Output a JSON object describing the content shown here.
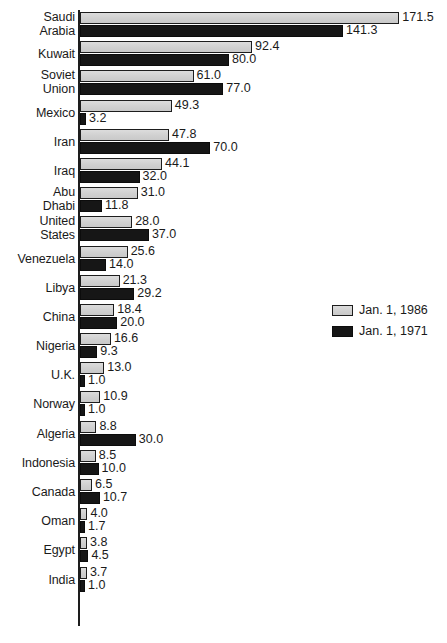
{
  "chart_data": {
    "type": "bar",
    "orientation": "horizontal",
    "title": "",
    "subtitle": "",
    "xlabel": "",
    "ylabel": "",
    "grid": false,
    "axis_range": [
      0,
      171.5
    ],
    "value_format": "one-decimal",
    "legend_position": "right-middle",
    "categories": [
      "Saudi\nArabia",
      "Kuwait",
      "Soviet\nUnion",
      "Mexico",
      "Iran",
      "Iraq",
      "Abu\nDhabi",
      "United\nStates",
      "Venezuela",
      "Libya",
      "China",
      "Nigeria",
      "U.K.",
      "Norway",
      "Algeria",
      "Indonesia",
      "Canada",
      "Oman",
      "Egypt",
      "India"
    ],
    "series": [
      {
        "name": "Jan. 1, 1986",
        "color": "#d2d2d2",
        "values": [
          171.5,
          92.4,
          61.0,
          49.3,
          47.8,
          44.1,
          31.0,
          28.0,
          25.6,
          21.3,
          18.4,
          16.6,
          13.0,
          10.9,
          8.8,
          8.5,
          6.5,
          4.0,
          3.8,
          3.7
        ],
        "labels": [
          "171.5",
          "92.4",
          "61.0",
          "49.3",
          "47.8",
          "44.1",
          "31.0",
          "28.0",
          "25.6",
          "21.3",
          "18.4",
          "16.6",
          "13.0",
          "10.9",
          "8.8",
          "8.5",
          "6.5",
          "4.0",
          "3.8",
          "3.7"
        ]
      },
      {
        "name": "Jan. 1, 1971",
        "color": "#161616",
        "values": [
          141.3,
          80.0,
          77.0,
          3.2,
          70.0,
          32.0,
          11.8,
          37.0,
          14.0,
          29.2,
          20.0,
          9.3,
          1.0,
          1.0,
          30.0,
          10.0,
          10.7,
          1.7,
          4.5,
          1.0
        ],
        "labels": [
          "141.3",
          "80.0",
          "77.0",
          "3.2",
          "70.0",
          "32.0",
          "11.8",
          "37.0",
          "14.0",
          "29.2",
          "20.0",
          "9.3",
          "1.0",
          "1.0",
          "30.0",
          "10.0",
          "10.7",
          "1.7",
          "4.5",
          "1.0"
        ]
      }
    ]
  },
  "legend": {
    "items": [
      {
        "label": "Jan. 1, 1986",
        "swatch": "light"
      },
      {
        "label": "Jan. 1, 1971",
        "swatch": "dark"
      }
    ]
  }
}
